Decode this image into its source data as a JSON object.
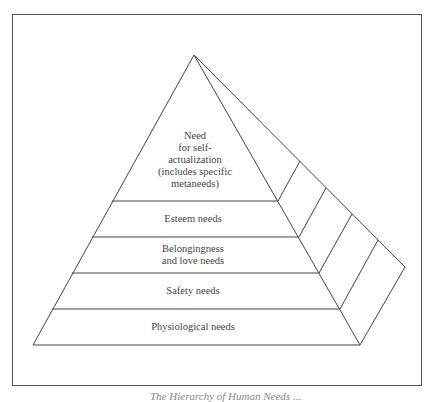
{
  "diagram": {
    "type": "pyramid",
    "levels": [
      {
        "label_lines": [
          "Need",
          "for self-",
          "actualization",
          "(includes specific",
          "metaneeds)"
        ]
      },
      {
        "label_lines": [
          "Esteem needs"
        ]
      },
      {
        "label_lines": [
          "Belongingness",
          "and love needs"
        ]
      },
      {
        "label_lines": [
          "Safety needs"
        ]
      },
      {
        "label_lines": [
          "Physiological needs"
        ]
      }
    ]
  },
  "caption": "The Hierarchy of Human Needs ..."
}
